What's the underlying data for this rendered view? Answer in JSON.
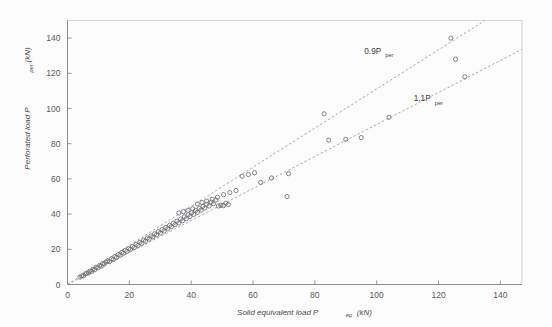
{
  "chart_data": {
    "type": "scatter",
    "title": "",
    "xlabel": "Solid equivalent load P",
    "xlabel_sub": "eq",
    "xlabel_unit": "(kN)",
    "ylabel": "Perforated load P",
    "ylabel_sub": "per",
    "ylabel_unit": "(kN)",
    "xticks": [
      0,
      20,
      40,
      60,
      80,
      100,
      120,
      140
    ],
    "yticks": [
      0,
      20,
      40,
      60,
      80,
      100,
      120,
      140
    ],
    "xlim": [
      0,
      147
    ],
    "ylim": [
      0,
      150
    ],
    "grid": false,
    "legend": "none",
    "marker": "open-circle",
    "marker_color": "#6e6e73",
    "annotations": [
      {
        "text": "0.9P",
        "sub": "per",
        "x": 96,
        "y": 131
      },
      {
        "text": "1.1P",
        "sub": "per",
        "x": 112,
        "y": 104
      }
    ],
    "reference_lines": [
      {
        "name": "0.9P_per",
        "slope": 1.1111,
        "intercept": 0,
        "style": "dashed",
        "color": "#9a9a9a"
      },
      {
        "name": "1.1P_per",
        "slope": 0.9091,
        "intercept": 0,
        "style": "dashed",
        "color": "#9a9a9a"
      }
    ],
    "points": [
      [
        4.0,
        4.2
      ],
      [
        4.6,
        4.8
      ],
      [
        5.2,
        5.0
      ],
      [
        5.8,
        6.0
      ],
      [
        6.2,
        6.4
      ],
      [
        6.8,
        6.6
      ],
      [
        7.2,
        7.6
      ],
      [
        7.8,
        7.4
      ],
      [
        8.2,
        8.6
      ],
      [
        8.8,
        8.4
      ],
      [
        9.2,
        9.8
      ],
      [
        9.8,
        9.4
      ],
      [
        10.4,
        10.8
      ],
      [
        10.9,
        10.4
      ],
      [
        11.4,
        12.0
      ],
      [
        11.9,
        11.6
      ],
      [
        12.4,
        12.8
      ],
      [
        13.0,
        13.4
      ],
      [
        13.6,
        13.0
      ],
      [
        14.2,
        14.6
      ],
      [
        14.8,
        14.2
      ],
      [
        15.3,
        15.8
      ],
      [
        15.9,
        15.4
      ],
      [
        16.4,
        17.0
      ],
      [
        17.0,
        16.6
      ],
      [
        17.6,
        18.2
      ],
      [
        18.1,
        17.8
      ],
      [
        18.7,
        19.4
      ],
      [
        19.2,
        18.8
      ],
      [
        19.8,
        20.4
      ],
      [
        20.4,
        20.0
      ],
      [
        21.0,
        21.6
      ],
      [
        21.6,
        21.0
      ],
      [
        22.2,
        22.8
      ],
      [
        22.8,
        22.2
      ],
      [
        23.4,
        24.0
      ],
      [
        24.0,
        23.4
      ],
      [
        24.6,
        25.2
      ],
      [
        25.2,
        24.6
      ],
      [
        25.8,
        26.4
      ],
      [
        26.4,
        25.8
      ],
      [
        27.0,
        27.6
      ],
      [
        27.6,
        27.0
      ],
      [
        28.2,
        28.8
      ],
      [
        28.8,
        28.2
      ],
      [
        29.4,
        30.0
      ],
      [
        30.0,
        29.2
      ],
      [
        30.6,
        31.2
      ],
      [
        31.2,
        30.4
      ],
      [
        31.8,
        32.4
      ],
      [
        32.4,
        31.6
      ],
      [
        33.0,
        33.6
      ],
      [
        33.6,
        32.8
      ],
      [
        34.2,
        34.8
      ],
      [
        34.8,
        34.0
      ],
      [
        35.4,
        36.0
      ],
      [
        36.0,
        35.0
      ],
      [
        36.6,
        37.2
      ],
      [
        37.2,
        36.2
      ],
      [
        37.8,
        38.4
      ],
      [
        38.4,
        37.4
      ],
      [
        39.0,
        39.6
      ],
      [
        39.6,
        38.6
      ],
      [
        40.2,
        40.8
      ],
      [
        40.8,
        39.8
      ],
      [
        41.4,
        42.0
      ],
      [
        42.0,
        41.0
      ],
      [
        42.6,
        43.2
      ],
      [
        43.2,
        42.2
      ],
      [
        43.8,
        44.4
      ],
      [
        44.4,
        43.4
      ],
      [
        45.0,
        45.6
      ],
      [
        45.8,
        44.6
      ],
      [
        46.5,
        46.8
      ],
      [
        47.2,
        45.8
      ],
      [
        48.0,
        48.0
      ],
      [
        48.8,
        44.6
      ],
      [
        49.6,
        45.0
      ],
      [
        50.4,
        44.8
      ],
      [
        51.2,
        46.2
      ],
      [
        52.0,
        45.4
      ],
      [
        36.0,
        40.6
      ],
      [
        37.5,
        41.4
      ],
      [
        39.0,
        42.2
      ],
      [
        40.5,
        43.0
      ],
      [
        42.0,
        45.8
      ],
      [
        43.5,
        46.6
      ],
      [
        45.0,
        47.4
      ],
      [
        46.8,
        48.4
      ],
      [
        48.5,
        49.6
      ],
      [
        50.5,
        51.0
      ],
      [
        52.5,
        52.2
      ],
      [
        54.5,
        53.4
      ],
      [
        56.5,
        61.5
      ],
      [
        58.5,
        62.5
      ],
      [
        60.5,
        63.5
      ],
      [
        62.5,
        58.0
      ],
      [
        66.0,
        60.5
      ],
      [
        71.0,
        50.0
      ],
      [
        71.5,
        63.0
      ],
      [
        83.0,
        97.0
      ],
      [
        84.5,
        82.0
      ],
      [
        90.0,
        82.5
      ],
      [
        95.0,
        83.5
      ],
      [
        104.0,
        95.0
      ],
      [
        124.0,
        140.0
      ],
      [
        125.5,
        128.0
      ],
      [
        128.5,
        118.0
      ]
    ]
  }
}
